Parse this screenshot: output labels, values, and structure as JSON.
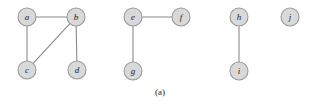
{
  "figure": {
    "caption": "(a)",
    "caption_x": 160,
    "caption_y": 92,
    "width": 315,
    "height": 105,
    "background": "#ffffff"
  },
  "style": {
    "node_fill": "#d9d9d9",
    "node_stroke": "#9a9a9a",
    "node_radius": 9,
    "edge_stroke": "#8a8a8a",
    "label_color": "#1a1a1a"
  },
  "graph": {
    "type": "undirected-graph",
    "node_count": 10,
    "edge_count": 7,
    "component_count": 4,
    "nodes": [
      {
        "id": "a",
        "label": "a",
        "x": 27,
        "y": 17,
        "component": 1
      },
      {
        "id": "b",
        "label": "b",
        "x": 76,
        "y": 17,
        "component": 1
      },
      {
        "id": "c",
        "label": "c",
        "x": 27,
        "y": 70,
        "component": 1
      },
      {
        "id": "d",
        "label": "d",
        "x": 77,
        "y": 70,
        "component": 1
      },
      {
        "id": "e",
        "label": "e",
        "x": 133,
        "y": 17,
        "component": 2
      },
      {
        "id": "f",
        "label": "f",
        "x": 181,
        "y": 17,
        "component": 2
      },
      {
        "id": "g",
        "label": "g",
        "x": 133,
        "y": 71,
        "component": 2
      },
      {
        "id": "h",
        "label": "h",
        "x": 239,
        "y": 17,
        "component": 3
      },
      {
        "id": "i",
        "label": "i",
        "x": 239,
        "y": 71,
        "component": 3
      },
      {
        "id": "j",
        "label": "j",
        "x": 290,
        "y": 17,
        "component": 4
      }
    ],
    "edges": [
      {
        "source": "a",
        "target": "b"
      },
      {
        "source": "a",
        "target": "c"
      },
      {
        "source": "b",
        "target": "c"
      },
      {
        "source": "b",
        "target": "d"
      },
      {
        "source": "e",
        "target": "f"
      },
      {
        "source": "e",
        "target": "g"
      },
      {
        "source": "h",
        "target": "i"
      }
    ],
    "components": [
      {
        "id": 1,
        "members": [
          "a",
          "b",
          "c",
          "d"
        ]
      },
      {
        "id": 2,
        "members": [
          "e",
          "f",
          "g"
        ]
      },
      {
        "id": 3,
        "members": [
          "h",
          "i"
        ]
      },
      {
        "id": 4,
        "members": [
          "j"
        ]
      }
    ]
  }
}
